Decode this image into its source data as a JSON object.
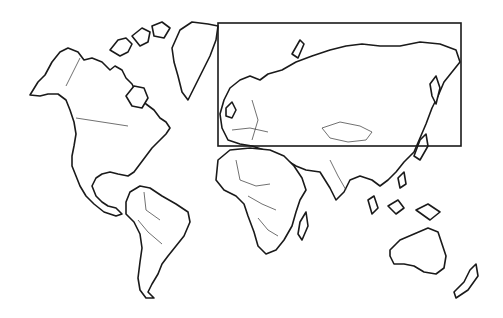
{
  "map": {
    "type": "world-outline",
    "projection": "political outline map",
    "background": "#ffffff",
    "stroke_color": "#1a1a1a",
    "highlight_region": {
      "label": "",
      "description": "Northern Eurasia (Europe and Russia) enclosed by rectangle",
      "x": 218,
      "y": 23,
      "width": 243,
      "height": 123,
      "stroke": "#1a1a1a"
    },
    "regions": [
      "North America",
      "Greenland",
      "South America",
      "Europe",
      "Africa",
      "Asia",
      "Australia",
      "New Zealand"
    ]
  }
}
